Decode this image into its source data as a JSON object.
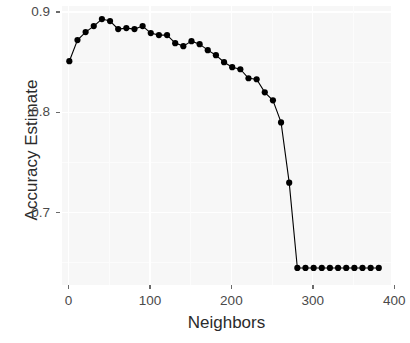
{
  "axes": {
    "y_title": "Accuracy Estimate",
    "x_title": "Neighbors",
    "y_ticks": [
      "0.9",
      "0.8",
      "0.7"
    ],
    "x_ticks": [
      "0",
      "100",
      "200",
      "300",
      "400"
    ]
  },
  "style": {
    "panel_bg": "#f7f7f7",
    "grid_major": "#ffffff",
    "point_color": "#000000",
    "line_color": "#000000",
    "text_color": "#4a4a4a",
    "title_color": "#2b2b2b"
  },
  "chart_data": {
    "type": "line",
    "title": "",
    "xlabel": "Neighbors",
    "ylabel": "Accuracy Estimate",
    "xlim": [
      -8,
      396
    ],
    "ylim": [
      0.628,
      0.906
    ],
    "xticks": [
      0,
      100,
      200,
      300,
      400
    ],
    "yticks": [
      0.9,
      0.8,
      0.7
    ],
    "grid": true,
    "legend": "none",
    "markers": "filled-circle",
    "series": [
      {
        "name": "Accuracy Estimate",
        "x": [
          1,
          11,
          21,
          31,
          41,
          51,
          61,
          71,
          81,
          91,
          101,
          111,
          121,
          131,
          141,
          151,
          161,
          171,
          181,
          191,
          201,
          211,
          221,
          231,
          241,
          251,
          261,
          271,
          281,
          291,
          301,
          311,
          321,
          331,
          341,
          351,
          361,
          371,
          381
        ],
        "y": [
          0.851,
          0.872,
          0.88,
          0.886,
          0.893,
          0.891,
          0.883,
          0.884,
          0.883,
          0.886,
          0.879,
          0.877,
          0.877,
          0.869,
          0.866,
          0.871,
          0.868,
          0.862,
          0.857,
          0.85,
          0.845,
          0.843,
          0.834,
          0.833,
          0.82,
          0.812,
          0.79,
          0.73,
          0.645,
          0.645,
          0.645,
          0.645,
          0.645,
          0.645,
          0.645,
          0.645,
          0.645,
          0.645,
          0.645
        ]
      }
    ]
  }
}
